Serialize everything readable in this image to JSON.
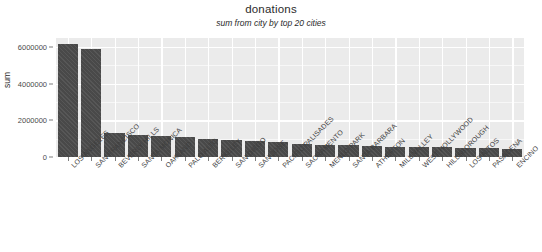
{
  "chart_data": {
    "type": "bar",
    "title": "donations",
    "subtitle": "sum from city by top 20 cities",
    "xlabel": "",
    "ylabel": "sum",
    "ylim": [
      0,
      6500000
    ],
    "grid": true,
    "legend": "none",
    "y_ticks": [
      {
        "value": 0,
        "label": "0"
      },
      {
        "value": 2000000,
        "label": "2000000"
      },
      {
        "value": 4000000,
        "label": "4000000"
      },
      {
        "value": 6000000,
        "label": "6000000"
      }
    ],
    "categories": [
      "LOS ANGELES",
      "SAN FRANCISCO",
      "BEVERLY HILLS",
      "SANTA MONICA",
      "OAKLAND",
      "PALO ALTO",
      "BERKELEY",
      "SAN DIEGO",
      "SAN JOSE",
      "PACIFIC PALISADES",
      "SACRAMENTO",
      "MENLO PARK",
      "SANTA BARBARA",
      "ATHERTON",
      "MILL VALLEY",
      "WEST HOLLYWOOD",
      "HILLSBOROUGH",
      "LOS ALTOS",
      "PASADENA",
      "ENCINO"
    ],
    "values": [
      6200000,
      5900000,
      1320000,
      1200000,
      1150000,
      1100000,
      980000,
      930000,
      880000,
      800000,
      700000,
      660000,
      640000,
      600000,
      560000,
      540000,
      520000,
      500000,
      480000,
      460000
    ],
    "colors": {
      "bar_fill": "#4d4d4d",
      "panel_background": "#ebebeb",
      "gridline": "#ffffff",
      "figure_background": "#ffffff",
      "text": "#2b2b2b"
    }
  }
}
